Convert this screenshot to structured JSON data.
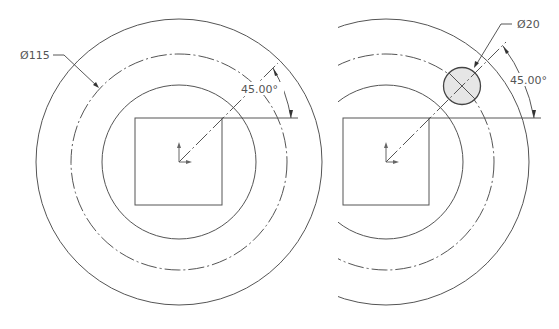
{
  "views": [
    {
      "name": "left-view",
      "dimensions": {
        "diameter_label": "Ø115",
        "angle_label": "45.00°"
      }
    },
    {
      "name": "right-view",
      "dimensions": {
        "diameter_label": "Ø20",
        "angle_label": "45.00°"
      }
    }
  ],
  "colors": {
    "line": "#555555",
    "hole_fill": "#e6e6e6"
  }
}
